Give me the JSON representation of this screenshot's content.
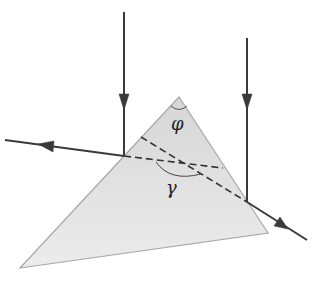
{
  "diagram": {
    "labels": {
      "apex_angle": "φ",
      "deviation_angle": "γ"
    },
    "colors": {
      "prism_fill_top": "#d6d6d6",
      "prism_fill_bottom": "#ececec",
      "prism_edge": "#a8a8a8",
      "ray": "#3a3a3a"
    },
    "prism": {
      "apex": [
        179,
        97
      ],
      "left_vertex": [
        20,
        268
      ],
      "right_vertex": [
        268,
        233
      ]
    },
    "rays": [
      {
        "name": "incident-ray-left",
        "from": [
          124,
          12
        ],
        "to": [
          124,
          156
        ]
      },
      {
        "name": "reflected-ray-left",
        "from": [
          124,
          156
        ],
        "to": [
          5,
          140
        ]
      },
      {
        "name": "incident-ray-right",
        "from": [
          247,
          38
        ],
        "to": [
          247,
          202
        ]
      },
      {
        "name": "reflected-ray-right",
        "from": [
          247,
          202
        ],
        "to": [
          307,
          240
        ]
      }
    ],
    "construction_lines": [
      {
        "name": "extension-line-left",
        "from": [
          124,
          156
        ],
        "to": [
          223,
          168
        ]
      },
      {
        "name": "extension-line-right",
        "from": [
          141,
          137
        ],
        "to": [
          247,
          202
        ]
      }
    ]
  }
}
